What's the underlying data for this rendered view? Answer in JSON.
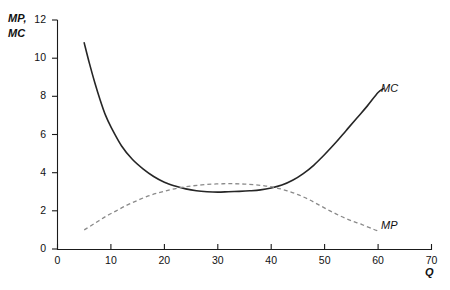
{
  "chart_data": {
    "type": "line",
    "title": "",
    "subtitle": "",
    "xlabel": "Q",
    "ylabel": "MP, MC",
    "ylabel_lines": [
      "MP,",
      "MC"
    ],
    "xlim": [
      0,
      70
    ],
    "ylim": [
      0,
      12
    ],
    "grid": false,
    "legend_position": "inline-right",
    "x_ticks": [
      0,
      10,
      20,
      30,
      40,
      50,
      60,
      70
    ],
    "x_tick_labels": [
      "0",
      "10",
      "20",
      "30",
      "40",
      "50",
      "60",
      "70"
    ],
    "y_ticks": [
      0,
      2,
      4,
      6,
      8,
      10,
      12
    ],
    "y_tick_labels": [
      "0",
      "2",
      "4",
      "6",
      "8",
      "10",
      "12"
    ],
    "series": [
      {
        "name": "MC",
        "label": "MC",
        "style": "solid",
        "color": "#262626",
        "x": [
          5,
          6,
          7,
          8,
          9,
          10,
          12,
          14,
          16,
          18,
          20,
          22,
          24,
          26,
          28,
          30,
          32,
          34,
          36,
          38,
          40,
          42,
          44,
          46,
          48,
          50,
          52,
          54,
          56,
          58,
          60,
          61
        ],
        "values": [
          10.8,
          9.7,
          8.7,
          7.8,
          7.0,
          6.4,
          5.4,
          4.7,
          4.2,
          3.8,
          3.5,
          3.3,
          3.15,
          3.05,
          3.0,
          2.98,
          3.0,
          3.02,
          3.05,
          3.1,
          3.2,
          3.35,
          3.6,
          3.95,
          4.4,
          4.95,
          5.55,
          6.2,
          6.85,
          7.5,
          8.2,
          8.4
        ]
      },
      {
        "name": "MP",
        "label": "MP",
        "style": "dashed",
        "color": "#7a7a7a",
        "x": [
          5,
          7,
          9,
          11,
          13,
          15,
          17,
          19,
          21,
          23,
          25,
          27,
          29,
          31,
          33,
          35,
          37,
          39,
          41,
          43,
          45,
          47,
          49,
          51,
          53,
          55,
          57,
          59,
          60
        ],
        "values": [
          1.0,
          1.35,
          1.7,
          2.0,
          2.3,
          2.55,
          2.78,
          2.95,
          3.1,
          3.22,
          3.3,
          3.36,
          3.4,
          3.42,
          3.42,
          3.4,
          3.36,
          3.3,
          3.2,
          3.05,
          2.85,
          2.6,
          2.3,
          2.0,
          1.72,
          1.48,
          1.28,
          1.05,
          0.95
        ]
      }
    ],
    "intersections": [
      {
        "x": 25,
        "y": 3.22
      },
      {
        "x": 40,
        "y": 3.2
      }
    ]
  }
}
